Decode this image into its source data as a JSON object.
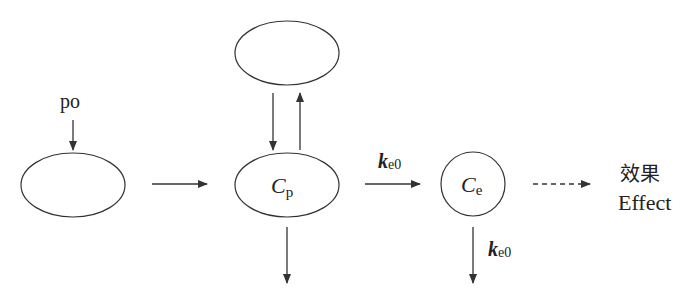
{
  "diagram": {
    "type": "pharmacokinetic-effect-compartment",
    "input_label": "po",
    "nodes": [
      {
        "id": "absorption",
        "label": ""
      },
      {
        "id": "peripheral",
        "label": ""
      },
      {
        "id": "central",
        "label_main": "C",
        "label_sub": "p"
      },
      {
        "id": "effect",
        "label_main": "C",
        "label_sub": "e"
      }
    ],
    "edges": [
      {
        "from": "po",
        "to": "absorption",
        "style": "solid"
      },
      {
        "from": "absorption",
        "to": "central",
        "style": "solid"
      },
      {
        "from": "peripheral",
        "to": "central",
        "style": "solid"
      },
      {
        "from": "central",
        "to": "peripheral",
        "style": "solid"
      },
      {
        "from": "central",
        "to": "elimination",
        "style": "solid"
      },
      {
        "from": "central",
        "to": "effect",
        "style": "solid",
        "label_main": "k",
        "label_sub": "e0"
      },
      {
        "from": "effect",
        "to": "elimination",
        "style": "solid",
        "label_main": "k",
        "label_sub": "e0"
      },
      {
        "from": "effect",
        "to": "outcome",
        "style": "dashed"
      }
    ],
    "outcome_label_cn": "效果",
    "outcome_label_en": "Effect"
  }
}
